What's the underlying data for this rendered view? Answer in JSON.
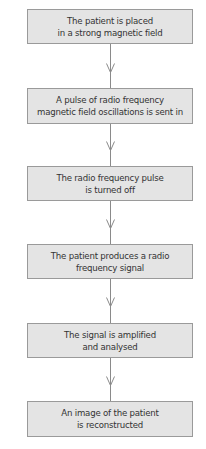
{
  "diagram": {
    "type": "flowchart",
    "direction": "top-to-bottom",
    "colors": {
      "box_fill": "#e4e4e4",
      "box_border": "#9a9a9a",
      "arrow": "#8a8a8a",
      "text": "#333333"
    },
    "steps": [
      {
        "line1": "The patient is placed",
        "line2": "in a strong magnetic field"
      },
      {
        "line1": "A pulse of radio frequency",
        "line2": "magnetic field oscillations is sent in"
      },
      {
        "line1": "The radio frequency pulse",
        "line2": "is turned off"
      },
      {
        "line1": "The patient produces a radio",
        "line2": "frequency signal"
      },
      {
        "line1": "The signal is amplified",
        "line2": "and analysed"
      },
      {
        "line1": "An image of the patient",
        "line2": "is reconstructed"
      }
    ],
    "arrow_icon": "open-chevron-down-arrow"
  }
}
